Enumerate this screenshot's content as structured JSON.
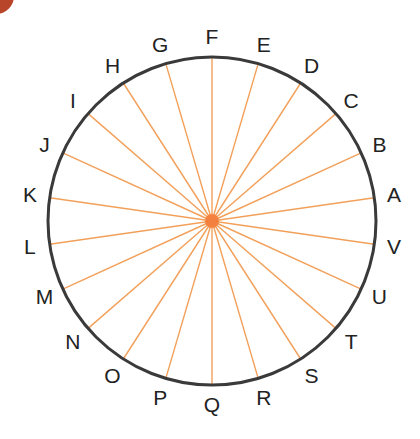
{
  "diagram": {
    "type": "circle-with-radial-spokes",
    "center": {
      "x": 212,
      "y": 221
    },
    "radius": 164,
    "label_radius": 184,
    "start_angle_deg": 8.1818,
    "direction": "counter-clockwise",
    "colors": {
      "circle": "#3a3a3a",
      "spokes": "#f2a05a",
      "hub": "#f47a3a",
      "labels": "#222222",
      "corner_blob": "#b8442a"
    },
    "points": [
      "A",
      "B",
      "C",
      "D",
      "E",
      "F",
      "G",
      "H",
      "I",
      "J",
      "K",
      "L",
      "M",
      "N",
      "O",
      "P",
      "Q",
      "R",
      "S",
      "T",
      "U",
      "V"
    ]
  }
}
